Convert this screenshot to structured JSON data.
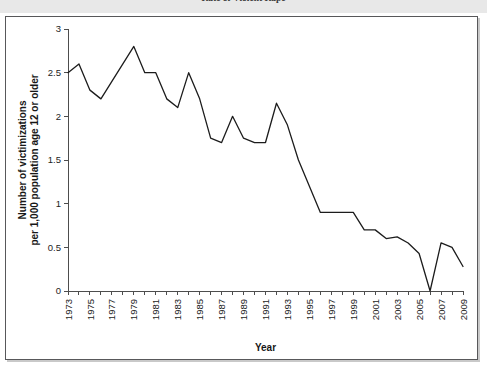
{
  "header": {
    "title": "Rate of Violent Rape"
  },
  "figure": {
    "background_color": "#ffffff",
    "border_color": "#58585a"
  },
  "chart_data": {
    "type": "line",
    "title": "",
    "subtitle": "",
    "xlabel": "Year",
    "ylabel": "Number of victimizations per 1,000 population age 12 or older",
    "ylabel_line1": "Number of victimizations",
    "ylabel_line2": "per 1,000 population age 12 or older",
    "xlim": [
      1973,
      2009
    ],
    "ylim": [
      0,
      3
    ],
    "grid": false,
    "legend": "none",
    "line_color": "#1c1c1c",
    "y_ticks": [
      0,
      0.5,
      1,
      1.5,
      2,
      2.5,
      3
    ],
    "y_tick_labels": [
      "0",
      "0.5",
      "1",
      "1.5",
      "2",
      "2.5",
      "3"
    ],
    "x_tick_labels": [
      "1973",
      "1975",
      "1977",
      "1979",
      "1981",
      "1983",
      "1985",
      "1987",
      "1989",
      "1991",
      "1993",
      "1995",
      "1997",
      "1999",
      "2001",
      "2003",
      "2005",
      "2007",
      "2009"
    ],
    "x": [
      1973,
      1974,
      1975,
      1976,
      1977,
      1978,
      1979,
      1980,
      1981,
      1982,
      1983,
      1984,
      1985,
      1986,
      1987,
      1988,
      1989,
      1990,
      1991,
      1992,
      1993,
      1994,
      1995,
      1996,
      1997,
      1998,
      1999,
      2000,
      2001,
      2002,
      2003,
      2004,
      2005,
      2006,
      2007,
      2008,
      2009
    ],
    "values": [
      2.5,
      2.6,
      2.3,
      2.2,
      2.4,
      2.6,
      2.8,
      2.5,
      2.5,
      2.2,
      2.1,
      2.5,
      2.2,
      1.75,
      1.7,
      2.0,
      1.75,
      1.7,
      1.7,
      2.15,
      1.9,
      1.5,
      1.2,
      0.9,
      0.9,
      0.9,
      0.9,
      0.7,
      0.7,
      0.6,
      0.62,
      0.55,
      0.43,
      0.0,
      0.55,
      0.5,
      0.28
    ]
  }
}
